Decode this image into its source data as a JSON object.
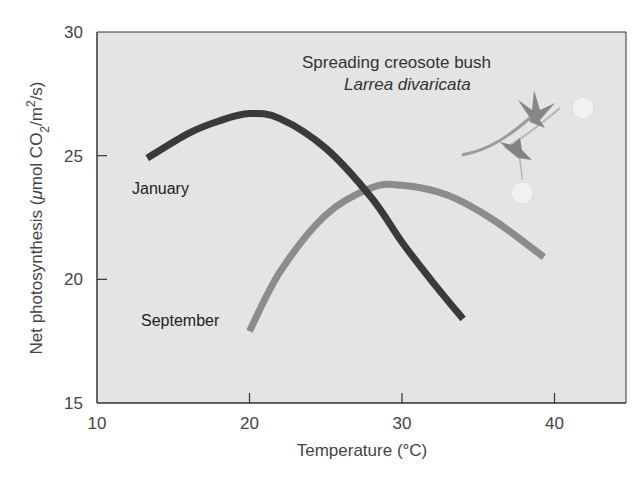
{
  "chart_data": {
    "type": "line",
    "title": "",
    "xlabel": "Temperature (°C)",
    "ylabel": "Net photosynthesis (μmol CO2/m2/s)",
    "ylabel_parts": {
      "prefix": "Net photosynthesis (",
      "mu": "μ",
      "unit1": "mol CO",
      "sub": "2",
      "unit2": "/m",
      "sup": "2",
      "unit3": "/s)"
    },
    "xlim": [
      10,
      44.7
    ],
    "ylim": [
      15,
      30
    ],
    "xticks": [
      10,
      20,
      30,
      40
    ],
    "yticks": [
      15,
      20,
      25,
      30
    ],
    "grid": false,
    "legend_position": "inline labels",
    "series": [
      {
        "name": "January",
        "color": "#3a3a3a",
        "x": [
          13.3,
          16,
          18,
          20,
          22,
          25,
          28,
          30,
          32,
          34
        ],
        "y": [
          24.9,
          25.9,
          26.4,
          26.7,
          26.5,
          25.3,
          23.3,
          21.5,
          19.9,
          18.4
        ]
      },
      {
        "name": "September",
        "color": "#8c8c8c",
        "x": [
          20,
          22,
          25,
          28,
          30,
          33,
          36,
          39.3
        ],
        "y": [
          17.9,
          20.3,
          22.6,
          23.7,
          23.8,
          23.4,
          22.4,
          20.9
        ]
      }
    ],
    "annotations": [
      {
        "text": "Spreading creosote bush",
        "style": "normal"
      },
      {
        "text": "Larrea divaricata",
        "style": "italic"
      }
    ]
  },
  "labels": {
    "january": "January",
    "september": "September",
    "annotation_common": "Spreading creosote bush",
    "annotation_latin": "Larrea divaricata",
    "x_axis_title": "Temperature (°C)"
  },
  "ticks": {
    "x": [
      "10",
      "20",
      "30",
      "40"
    ],
    "y": [
      "30",
      "25",
      "20",
      "15"
    ]
  },
  "colors": {
    "plot_bg": "#e4e4e4",
    "axis": "#333333",
    "january": "#3a3a3a",
    "september": "#8c8c8c"
  }
}
